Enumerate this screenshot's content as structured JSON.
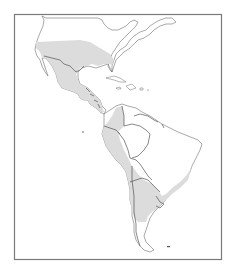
{
  "map": {
    "title": "",
    "region": "The Americas (North, Central and South America)",
    "colors": {
      "background": "#ffffff",
      "land": "#ffffff",
      "distribution_range": "#dcdcdc",
      "outline": "#6e6e6e",
      "frame": "#7a7a7a"
    },
    "shaded_regions": [
      "Southern United States band",
      "Mexico",
      "Central America",
      "Western Colombia",
      "Ecuador",
      "Peru",
      "Bolivia",
      "Paraguay",
      "Northern and central Argentina",
      "Uruguay",
      "Southeastern Brazil"
    ],
    "labels": []
  }
}
